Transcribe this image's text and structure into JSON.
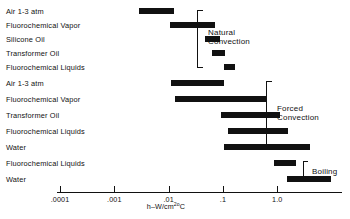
{
  "chart_data": {
    "type": "bar",
    "orientation": "horizontal",
    "title": "",
    "xlabel": "h–W/cm²°C",
    "ylabel": "",
    "xscale": "log",
    "xlim": [
      0.0001,
      10.0
    ],
    "grid": false,
    "tick_labels": [
      ".0001",
      ".001",
      ".01",
      ".1",
      "1.0"
    ],
    "tick_values": [
      0.0001,
      0.001,
      0.01,
      0.1,
      1.0
    ],
    "groups": [
      {
        "name": "Natural Convection",
        "label_lines": [
          "Natural",
          "Convection"
        ],
        "bars": [
          {
            "label": "Air 1-3 atm",
            "low": 0.0028,
            "high": 0.0125
          },
          {
            "label": "Fluorochemical Vapor",
            "low": 0.0105,
            "high": 0.073
          },
          {
            "label": "Silicone Oil",
            "low": 0.047,
            "high": 0.088
          },
          {
            "label": "Transformer Oil",
            "low": 0.062,
            "high": 0.11
          },
          {
            "label": "Fluorochemical  Liquids",
            "low": 0.105,
            "high": 0.165
          }
        ]
      },
      {
        "name": "Forced Convection",
        "label_lines": [
          "Forced",
          "Convection"
        ],
        "bars": [
          {
            "label": "Air 1-3 atm",
            "low": 0.011,
            "high": 0.105
          },
          {
            "label": "Fluorochemical  Vapor",
            "low": 0.013,
            "high": 0.63
          },
          {
            "label": "Transformer Oil",
            "low": 0.092,
            "high": 1.12
          },
          {
            "label": "Fluorochemical  Liquids",
            "low": 0.125,
            "high": 1.55
          },
          {
            "label": "Water",
            "low": 0.107,
            "high": 4.0
          }
        ]
      },
      {
        "name": "Boiling",
        "label_lines": [
          "Boiling"
        ],
        "bars": [
          {
            "label": "Fluorochemical  Liquids",
            "low": 0.86,
            "high": 2.2
          },
          {
            "label": "Water",
            "low": 1.5,
            "high": 10.0
          }
        ]
      }
    ]
  }
}
